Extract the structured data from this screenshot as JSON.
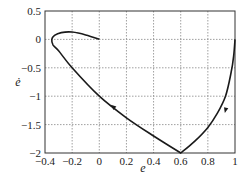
{
  "chart_data": {
    "type": "line",
    "title": "",
    "xlabel": "e",
    "ylabel": "ė",
    "xlim": [
      -0.4,
      1
    ],
    "ylim": [
      -2,
      0.5
    ],
    "grid": true,
    "x_ticks": [
      -0.4,
      -0.2,
      0,
      0.2,
      0.4,
      0.6,
      0.8,
      1
    ],
    "x_tick_labels": [
      "−0.4",
      "−0.2",
      "0",
      "0.2",
      "0.4",
      "0.6",
      "0.8",
      "1"
    ],
    "y_ticks": [
      0.5,
      0,
      -0.5,
      -1,
      -1.5,
      -2
    ],
    "y_tick_labels": [
      "0.5",
      "0",
      "−0.5",
      "−1",
      "−1.5",
      "−2"
    ],
    "series": [
      {
        "name": "phase trajectory",
        "x": [
          0,
          -0.1,
          -0.2,
          -0.28,
          -0.33,
          -0.35,
          -0.34,
          -0.3,
          -0.2,
          0,
          0.2,
          0.4,
          0.6,
          0.7,
          0.8,
          0.87,
          0.93,
          0.97,
          0.99,
          1.0
        ],
        "y": [
          0,
          0.08,
          0.13,
          0.12,
          0.07,
          0.0,
          -0.1,
          -0.2,
          -0.5,
          -1,
          -1.38,
          -1.7,
          -2,
          -1.8,
          -1.55,
          -1.3,
          -1.0,
          -0.6,
          -0.3,
          0.0
        ]
      }
    ],
    "annotations": [
      {
        "type": "arrow",
        "at": [
          0.1,
          -1.18
        ],
        "direction": "up-left"
      },
      {
        "type": "arrow",
        "at": [
          0.93,
          -1.25
        ],
        "direction": "down"
      }
    ]
  },
  "colors": {
    "line": "#1a1a1a",
    "grid": "#888888",
    "axis": "#333333"
  }
}
